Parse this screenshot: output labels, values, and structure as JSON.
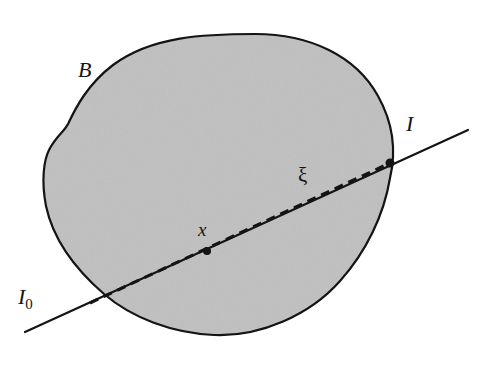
{
  "figure": {
    "kind": "geometry-diagram",
    "width": 490,
    "height": 365,
    "background_color": "#ffffff"
  },
  "region": {
    "name": "B",
    "label": "B",
    "fill_color": "#c8c8c8",
    "stroke_color": "#141414",
    "stroke_width": 2.2,
    "description": "closed convex-like blob with a concave notch on the upper-left boundary"
  },
  "line": {
    "name": "I",
    "label": "I",
    "stroke_color": "#141414",
    "stroke_width": 2.2,
    "start": {
      "x": 25,
      "y": 332
    },
    "end": {
      "x": 468,
      "y": 130
    }
  },
  "chord": {
    "name": "xi",
    "label": "ξ",
    "style": "dashed",
    "stroke_color": "#141414",
    "stroke_width": 3,
    "dash_length": 9,
    "dash_gap": 6,
    "start": {
      "x": 90,
      "y": 303
    },
    "end": {
      "x": 390,
      "y": 163
    }
  },
  "labels": {
    "region": "B",
    "line": "I",
    "line_origin": "I",
    "line_origin_subscript": "0",
    "chord": "ξ",
    "point": "x"
  },
  "points": [
    {
      "name": "x",
      "label": "x",
      "x": 207,
      "y": 251,
      "marker": "filled-dot",
      "radius": 4
    },
    {
      "name": "boundary-intersection",
      "label": "",
      "x": 390,
      "y": 163,
      "marker": "filled-dot",
      "radius": 4.5
    }
  ],
  "colors": {
    "ink": "#141414",
    "fill": "#c8c8c8",
    "paper": "#ffffff"
  }
}
